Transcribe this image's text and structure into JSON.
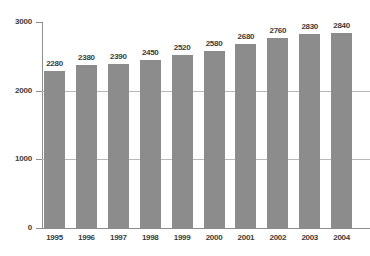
{
  "chart_data": {
    "type": "bar",
    "title": "",
    "subtitle": "",
    "xlabel": "",
    "ylabel": "",
    "categories": [
      "1995",
      "1996",
      "1997",
      "1998",
      "1999",
      "2000",
      "2001",
      "2002",
      "2003",
      "2004"
    ],
    "values": [
      2280,
      2380,
      2390,
      2450,
      2520,
      2580,
      2680,
      2760,
      2830,
      2840
    ],
    "data_labels": [
      "2280",
      "2380",
      "2390",
      "2450",
      "2520",
      "2580",
      "2680",
      "2760",
      "2830",
      "2840"
    ],
    "ylim": [
      0,
      3000
    ],
    "y_ticks": [
      0,
      1000,
      2000,
      3000
    ],
    "y_tick_labels": [
      "0",
      "1000",
      "2000",
      "3000"
    ],
    "gridlines": [
      1000,
      2000
    ],
    "grid": true,
    "legend": null,
    "legend_position": "none",
    "bar_color": "#8c8c8c",
    "grid_color": "#b9b9b9",
    "axis_color": "#8e8e8e",
    "label_color": "#3c3c3c",
    "background_color": "#ffffff"
  }
}
